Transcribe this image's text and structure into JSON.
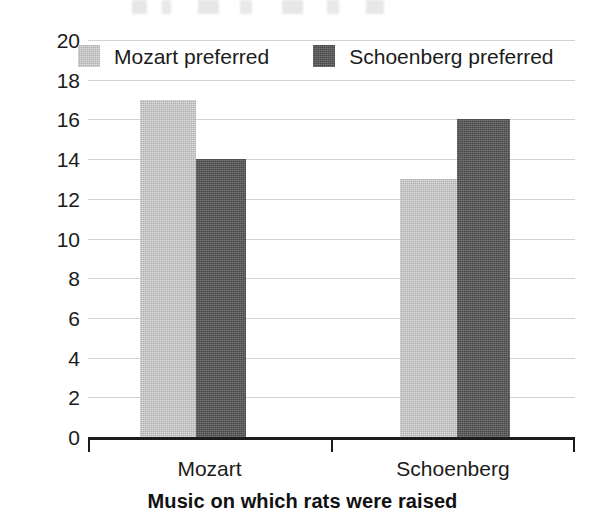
{
  "chart_data": {
    "type": "bar",
    "title": "",
    "subtitle": "",
    "xlabel": "Music on which rats were raised",
    "ylabel": "",
    "categories": [
      "Mozart",
      "Schoenberg"
    ],
    "series": [
      {
        "name": "Mozart preferred",
        "values": [
          17,
          13
        ],
        "color": "#c4c4c4"
      },
      {
        "name": "Schoenberg preferred",
        "values": [
          14,
          16
        ],
        "color": "#585858"
      }
    ],
    "ylim": [
      0,
      20
    ],
    "ytick_step": 2,
    "yticks": [
      20,
      18,
      16,
      14,
      12,
      10,
      8,
      6,
      4,
      2,
      0
    ],
    "grid": true,
    "grid_axis": "y",
    "legend_position": "top-left-inside",
    "grouped": true,
    "bar_gap_within_group": 0
  },
  "axes": {
    "y_tick_labels": [
      "20",
      "18",
      "16",
      "14",
      "12",
      "10",
      "8",
      "6",
      "4",
      "2",
      "0"
    ],
    "x_tick_labels": [
      "Mozart",
      "Schoenberg"
    ],
    "x_axis_title": "Music on which rats were raised"
  },
  "legend": {
    "items": [
      {
        "label": "Mozart preferred",
        "color": "#c4c4c4"
      },
      {
        "label": "Schoenberg preferred",
        "color": "#585858"
      }
    ]
  },
  "colors": {
    "bar_light": "#c4c4c4",
    "bar_dark": "#585858",
    "gridline": "#d2d2d2",
    "axis": "#1b1b1b",
    "text": "#1b1b1b",
    "background": "#ffffff"
  }
}
